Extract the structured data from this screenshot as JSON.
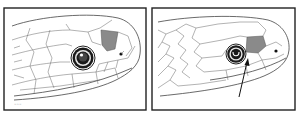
{
  "figure": {
    "type": "scientific-illustration",
    "panels": [
      {
        "id": "left",
        "frame": {
          "x": 4,
          "y": 8,
          "w": 142,
          "h": 102
        },
        "eye": {
          "cx": 83,
          "cy": 58,
          "r": 12
        },
        "highlighted_scale": {
          "color": "#8a8a8a",
          "points": "101,30 118,32 115,49 107,51 102,45"
        },
        "nostril": {
          "cx": 121,
          "cy": 54,
          "r": 1.6
        },
        "signature": "~"
      },
      {
        "id": "right",
        "frame": {
          "x": 152,
          "y": 8,
          "w": 143,
          "h": 102
        },
        "eye": {
          "cx": 236,
          "cy": 54,
          "r": 10
        },
        "highlighted_scale": {
          "color": "#8a8a8a",
          "points": "247,37 263,36 266,46 258,53 246,52"
        },
        "nostril": {
          "cx": 276,
          "cy": 51,
          "r": 1.6
        },
        "arrow": {
          "from": [
            239,
            97
          ],
          "to": [
            248,
            60
          ]
        }
      }
    ],
    "colors": {
      "frame": "#222222",
      "line": "#444444",
      "shade": "#8a8a8a",
      "background": "#ffffff"
    }
  }
}
